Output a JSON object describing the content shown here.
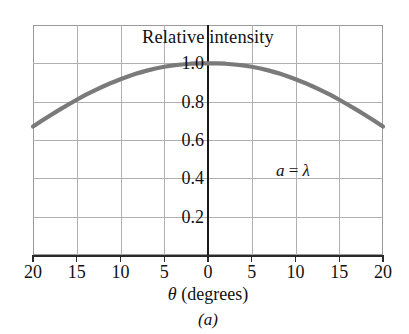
{
  "figure": {
    "caption": "(a)",
    "annotation_label": "a",
    "annotation_equals": " = ",
    "annotation_value": "λ"
  },
  "chart_data": {
    "type": "line",
    "title": "Relative intensity",
    "xlabel_symbol": "θ",
    "xlabel_units": " (degrees)",
    "ylabel": "",
    "xlim": [
      -20,
      20
    ],
    "ylim": [
      0,
      1.2
    ],
    "grid": true,
    "legend_position": "none",
    "annotations": [
      "a = λ"
    ],
    "xticks": [
      -20,
      -15,
      -10,
      -5,
      0,
      5,
      10,
      15,
      20
    ],
    "xtick_labels": [
      "20",
      "15",
      "10",
      "5",
      "0",
      "5",
      "10",
      "15",
      "20"
    ],
    "yticks": [
      0.2,
      0.4,
      0.6,
      0.8,
      1.0
    ],
    "ytick_labels": [
      "0.2",
      "0.4",
      "0.6",
      "0.8",
      "1.0"
    ],
    "line_color": "#7a7a7a",
    "line_width": 4.2,
    "series": [
      {
        "name": "a = λ",
        "x": [
          -20,
          -19,
          -18,
          -17,
          -16,
          -15,
          -14,
          -13,
          -12,
          -11,
          -10,
          -9,
          -8,
          -7,
          -6,
          -5,
          -4,
          -3,
          -2,
          -1,
          0,
          1,
          2,
          3,
          4,
          5,
          6,
          7,
          8,
          9,
          10,
          11,
          12,
          13,
          14,
          15,
          16,
          17,
          18,
          19,
          20
        ],
        "y": [
          0.67,
          0.7,
          0.729,
          0.757,
          0.784,
          0.81,
          0.835,
          0.858,
          0.879,
          0.899,
          0.917,
          0.934,
          0.949,
          0.962,
          0.973,
          0.982,
          0.989,
          0.994,
          0.998,
          1.0,
          1.0,
          1.0,
          0.998,
          0.994,
          0.989,
          0.982,
          0.973,
          0.962,
          0.949,
          0.934,
          0.917,
          0.899,
          0.879,
          0.858,
          0.835,
          0.81,
          0.784,
          0.757,
          0.729,
          0.7,
          0.67
        ]
      }
    ]
  },
  "colors": {
    "curve": "#7a7a7a",
    "grid": "#b0b0b0",
    "frame": "#9a9a9a",
    "axis": "#1a1a1a",
    "text": "#111111",
    "background": "#ffffff"
  }
}
